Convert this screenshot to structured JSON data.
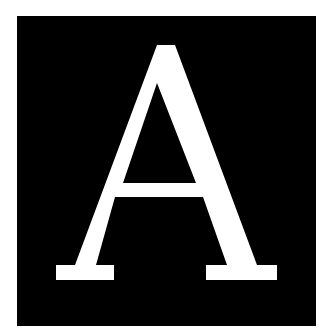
{
  "image": {
    "letter": "A",
    "description": "White serif capital letter on a black square",
    "colors": {
      "background": "#ffffff",
      "tile": "#000000",
      "glyph": "#ffffff"
    }
  }
}
